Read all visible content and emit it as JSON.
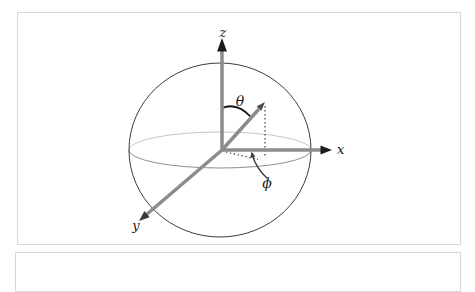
{
  "figure": {
    "name": "spherical-coordinate-system-diagram",
    "labels": {
      "z_axis": "z",
      "x_axis": "x",
      "y_axis": "y",
      "polar_angle": "θ",
      "azimuthal_angle": "ϕ"
    },
    "colors": {
      "background": "#ffffff",
      "panel_border": "#d8d8d8",
      "axis_gray": "#8c8c8c",
      "arrowhead_dark": "#1c1c1c",
      "sphere_outline": "#3b3b3b",
      "equator_back": "#c8c8c8",
      "equator_front": "#8f8f8f",
      "annotation_black": "#1a1a1a"
    }
  }
}
